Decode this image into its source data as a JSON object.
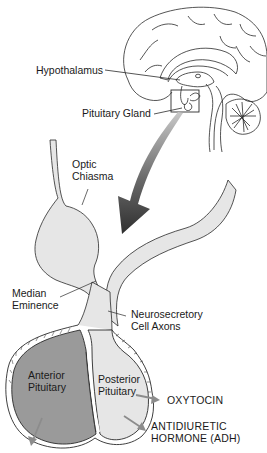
{
  "diagram": {
    "colors": {
      "line": "#2a2a2a",
      "anterior_fill": "#9a9a9a",
      "posterior_fill": "#e6e6e6",
      "arrow_dark": "#3a3a3a",
      "arrow_light": "#8a8a8a",
      "hormone_arrow": "#8c8c8c"
    },
    "labels": {
      "hypothalamus": "Hypothalamus",
      "pituitary_gland": "Pituitary Gland",
      "optic_chiasma_1": "Optic",
      "optic_chiasma_2": "Chiasma",
      "median_eminence_1": "Median",
      "median_eminence_2": "Eminence",
      "neurosecretory_1": "Neurosecretory",
      "neurosecretory_2": "Cell Axons",
      "anterior_1": "Anterior",
      "anterior_2": "Pituitary",
      "posterior_1": "Posterior",
      "posterior_2": "Pituitary",
      "oxytocin": "OXYTOCIN",
      "adh_1": "ANTIDIURETIC",
      "adh_2": "HORMONE (ADH)"
    }
  }
}
